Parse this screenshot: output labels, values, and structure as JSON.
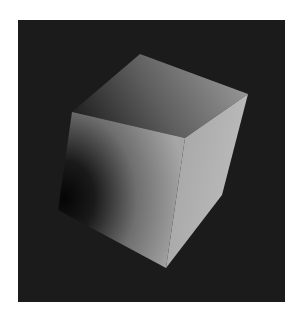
{
  "scene": {
    "subject": "shaded 3D cube",
    "background_color": "#1b1b1b",
    "page_color": "#ffffff",
    "frame": {
      "x": 18,
      "y": 20,
      "width": 267,
      "height": 282
    },
    "faces": {
      "top": {
        "points": "72,112 140,54 248,94 185,138",
        "color_dark": "#2a2a2a",
        "color_light": "#8c8c8c"
      },
      "right": {
        "points": "185,138 248,94 222,195 166,268",
        "color_dark": "#9a9a9a",
        "color_light": "#b8b8b8"
      },
      "front": {
        "points": "72,112 185,138 166,268 58,210",
        "color_dark": "#0a0a0a",
        "color_light": "#9e9e9e"
      }
    }
  }
}
